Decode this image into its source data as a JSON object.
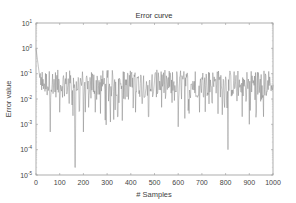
{
  "chart_data": {
    "type": "line",
    "title": "Error curve",
    "xlabel": "# Samples",
    "ylabel": "Error value",
    "xlim": [
      0,
      1000
    ],
    "ylim": [
      1e-05,
      10
    ],
    "yscale": "log",
    "grid": false,
    "legend": null,
    "xticks": [
      0,
      100,
      200,
      300,
      400,
      500,
      600,
      700,
      800,
      900,
      1000
    ],
    "xtick_labels": [
      "0",
      "100",
      "200",
      "300",
      "400",
      "500",
      "600",
      "700",
      "800",
      "900",
      "1000"
    ],
    "yticks": [
      1e-05,
      0.0001,
      0.001,
      0.01,
      0.1,
      1.0,
      10.0
    ],
    "ytick_exponents": [
      "-5",
      "-4",
      "-3",
      "-2",
      "-1",
      "0",
      "1"
    ],
    "series": [
      {
        "name": "error",
        "color": "#7a7a7a",
        "note": "noisy error signal; starts near 1, decays within ~20 samples to a band around 0.01-0.1 with frequent dips",
        "baseline_band": [
          0.01,
          0.12
        ],
        "start_value": 1.0,
        "notable_dips": [
          {
            "x": 60,
            "y": 0.0005
          },
          {
            "x": 100,
            "y": 0.003
          },
          {
            "x": 165,
            "y": 2e-05
          },
          {
            "x": 200,
            "y": 0.0005
          },
          {
            "x": 250,
            "y": 0.003
          },
          {
            "x": 345,
            "y": 0.002
          },
          {
            "x": 420,
            "y": 0.003
          },
          {
            "x": 475,
            "y": 0.002
          },
          {
            "x": 600,
            "y": 0.0008
          },
          {
            "x": 690,
            "y": 0.003
          },
          {
            "x": 810,
            "y": 0.0001
          },
          {
            "x": 870,
            "y": 0.002
          },
          {
            "x": 900,
            "y": 0.001
          },
          {
            "x": 960,
            "y": 0.002
          }
        ]
      }
    ]
  },
  "layout": {
    "plot_left": 36,
    "plot_top": 23,
    "plot_right": 273,
    "plot_bottom": 175
  }
}
